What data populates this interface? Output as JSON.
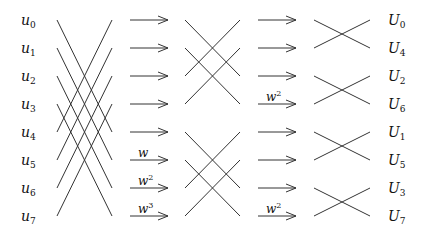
{
  "diagram": {
    "inputs": [
      {
        "base": "u",
        "sub": "0"
      },
      {
        "base": "u",
        "sub": "1"
      },
      {
        "base": "u",
        "sub": "2"
      },
      {
        "base": "u",
        "sub": "3"
      },
      {
        "base": "u",
        "sub": "4"
      },
      {
        "base": "u",
        "sub": "5"
      },
      {
        "base": "u",
        "sub": "6"
      },
      {
        "base": "u",
        "sub": "7"
      }
    ],
    "outputs": [
      {
        "base": "U",
        "sub": "0"
      },
      {
        "base": "U",
        "sub": "4"
      },
      {
        "base": "U",
        "sub": "2"
      },
      {
        "base": "U",
        "sub": "6"
      },
      {
        "base": "U",
        "sub": "1"
      },
      {
        "base": "U",
        "sub": "5"
      },
      {
        "base": "U",
        "sub": "3"
      },
      {
        "base": "U",
        "sub": "7"
      }
    ],
    "stage1_twiddles": [
      {
        "row": 5,
        "base": "w",
        "sup": ""
      },
      {
        "row": 6,
        "base": "w",
        "sup": "2"
      },
      {
        "row": 7,
        "base": "w",
        "sup": "3"
      }
    ],
    "stage2_twiddles": [
      {
        "row": 3,
        "base": "w",
        "sup": "2"
      },
      {
        "row": 7,
        "base": "w",
        "sup": "2"
      }
    ],
    "row_y": [
      20,
      48,
      76,
      104,
      132,
      160,
      188,
      216
    ],
    "colors": {
      "stroke": "#333333",
      "text": "#111111",
      "background": "#ffffff"
    }
  }
}
